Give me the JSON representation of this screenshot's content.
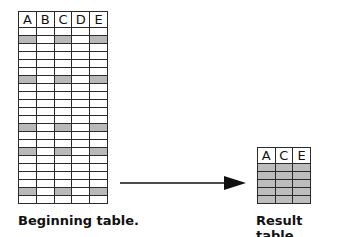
{
  "beginning_table": {
    "label": "Beginning table.",
    "columns": [
      "A",
      "B",
      "C",
      "D",
      "E"
    ],
    "row_count": 22,
    "shaded_rows": [
      1,
      6,
      12,
      15,
      20
    ],
    "shaded_columns": [
      "A",
      "C",
      "E"
    ],
    "shade_color": "#b9b9b9"
  },
  "result_table": {
    "label": "Result table.",
    "columns": [
      "A",
      "C",
      "E"
    ],
    "row_count": 5,
    "shade_color": "#bdbdbd"
  },
  "arrow": {
    "direction": "right",
    "from": "beginning_table",
    "to": "result_table"
  }
}
